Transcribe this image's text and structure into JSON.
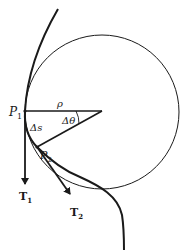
{
  "diagram": {
    "labels": {
      "p1": "P",
      "p1_sub": "1",
      "p2": "P",
      "p2_sub": "2",
      "rho": "ρ",
      "delta_theta": "Δθ",
      "delta_s": "Δs",
      "t1": "T",
      "t1_sub": "1",
      "t2": "T",
      "t2_sub": "2"
    },
    "colors": {
      "ink": "#1a1a1a",
      "background": "#ffffff"
    }
  }
}
